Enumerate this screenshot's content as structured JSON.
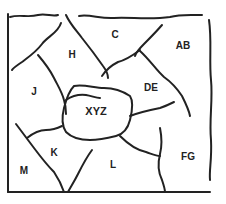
{
  "diagram": {
    "type": "region-map",
    "line_color": "#222222",
    "background": "#ffffff",
    "regions": [
      {
        "id": "C",
        "label": "C",
        "x": 115,
        "y": 35
      },
      {
        "id": "AB",
        "label": "AB",
        "x": 183,
        "y": 46
      },
      {
        "id": "H",
        "label": "H",
        "x": 72,
        "y": 55
      },
      {
        "id": "J",
        "label": "J",
        "x": 34,
        "y": 92
      },
      {
        "id": "DE",
        "label": "DE",
        "x": 151,
        "y": 88
      },
      {
        "id": "XYZ",
        "label": "XYZ",
        "x": 96,
        "y": 111
      },
      {
        "id": "K",
        "label": "K",
        "x": 54,
        "y": 153
      },
      {
        "id": "L",
        "label": "L",
        "x": 113,
        "y": 165
      },
      {
        "id": "FG",
        "label": "FG",
        "x": 188,
        "y": 157
      },
      {
        "id": "M",
        "label": "M",
        "x": 24,
        "y": 171
      }
    ]
  }
}
